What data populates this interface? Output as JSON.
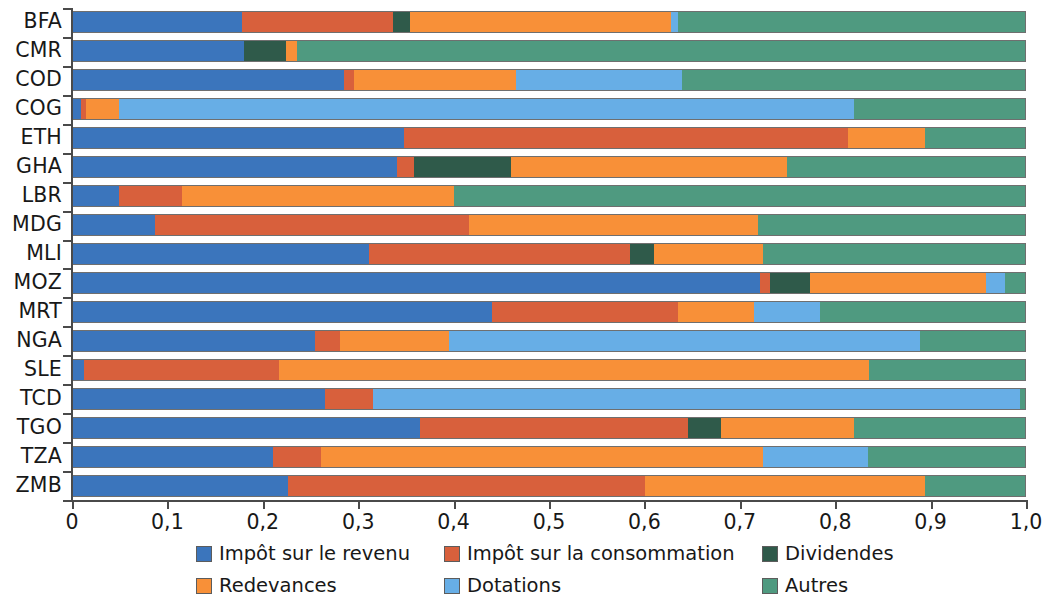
{
  "chart_data": {
    "type": "bar",
    "orientation": "horizontal",
    "stacked": true,
    "normalized": true,
    "title": "",
    "subtitle": "",
    "xlabel": "",
    "ylabel": "",
    "xlim": [
      0,
      1
    ],
    "grid": false,
    "legend_position": "bottom",
    "decimal_separator": ",",
    "x_ticks": [
      0,
      0.1,
      0.2,
      0.3,
      0.4,
      0.5,
      0.6,
      0.7,
      0.8,
      0.9,
      1.0
    ],
    "x_tick_labels": [
      "0",
      "0,1",
      "0,2",
      "0,3",
      "0,4",
      "0,5",
      "0,6",
      "0,7",
      "0,8",
      "0,9",
      "1,0"
    ],
    "categories": [
      "BFA",
      "CMR",
      "COD",
      "COG",
      "ETH",
      "GHA",
      "LBR",
      "MDG",
      "MLI",
      "MOZ",
      "MRT",
      "NGA",
      "SLE",
      "TCD",
      "TGO",
      "TZA",
      "ZMB"
    ],
    "series": [
      {
        "name": "Impôt sur le revenu",
        "color": "#3b75bc",
        "values": [
          0.178,
          0.18,
          0.285,
          0.008,
          0.348,
          0.34,
          0.048,
          0.086,
          0.311,
          0.722,
          0.44,
          0.254,
          0.012,
          0.265,
          0.365,
          0.21,
          0.226
        ]
      },
      {
        "name": "Impôt sur la consommation",
        "color": "#d8603c",
        "values": [
          0.158,
          0.0,
          0.01,
          0.006,
          0.466,
          0.018,
          0.066,
          0.33,
          0.274,
          0.01,
          0.196,
          0.026,
          0.204,
          0.05,
          0.281,
          0.05,
          0.375
        ]
      },
      {
        "name": "Dividendes",
        "color": "#2f5a4a",
        "values": [
          0.018,
          0.044,
          0.0,
          0.0,
          0.0,
          0.102,
          0.0,
          0.0,
          0.025,
          0.042,
          0.0,
          0.0,
          0.0,
          0.0,
          0.035,
          0.0,
          0.0
        ]
      },
      {
        "name": "Redevances",
        "color": "#f89038",
        "values": [
          0.274,
          0.011,
          0.17,
          0.034,
          0.081,
          0.29,
          0.286,
          0.304,
          0.115,
          0.185,
          0.079,
          0.115,
          0.62,
          0.0,
          0.139,
          0.465,
          0.294
        ]
      },
      {
        "name": "Dotations",
        "color": "#67aee6",
        "values": [
          0.008,
          0.0,
          0.175,
          0.772,
          0.0,
          0.0,
          0.0,
          0.0,
          0.0,
          0.02,
          0.07,
          0.495,
          0.0,
          0.68,
          0.0,
          0.11,
          0.0
        ]
      },
      {
        "name": "Autres",
        "color": "#4f9a80",
        "values": [
          0.364,
          0.765,
          0.36,
          0.18,
          0.105,
          0.25,
          0.6,
          0.28,
          0.275,
          0.021,
          0.215,
          0.11,
          0.164,
          0.005,
          0.18,
          0.165,
          0.105
        ]
      }
    ]
  },
  "legend": {
    "items": [
      {
        "label": "Impôt sur le revenu",
        "color": "#3b75bc"
      },
      {
        "label": "Impôt sur la consommation",
        "color": "#d8603c"
      },
      {
        "label": "Dividendes",
        "color": "#2f5a4a"
      },
      {
        "label": "Redevances",
        "color": "#f89038"
      },
      {
        "label": "Dotations",
        "color": "#67aee6"
      },
      {
        "label": "Autres",
        "color": "#4f9a80"
      }
    ]
  }
}
